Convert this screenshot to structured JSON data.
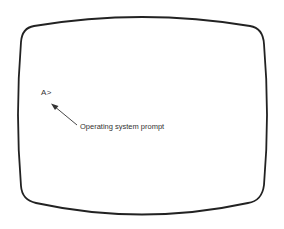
{
  "diagram": {
    "type": "crt-screen-illustration",
    "prompt_text": "A>",
    "annotation_label": "Operating system prompt",
    "colors": {
      "outline": "#222222",
      "text": "#333333",
      "background": "#ffffff"
    }
  }
}
